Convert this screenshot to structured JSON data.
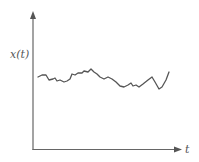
{
  "chart_data": {
    "type": "line",
    "title": "",
    "xlabel": "t",
    "ylabel": "x(t)",
    "grid": false,
    "legend": null,
    "axis_ranges": {
      "x": "unlabeled",
      "y": "unlabeled"
    },
    "series": [
      {
        "name": "x(t)",
        "points_px": [
          [
            38,
            77
          ],
          [
            42,
            75
          ],
          [
            46,
            75
          ],
          [
            49,
            80
          ],
          [
            53,
            79
          ],
          [
            55,
            78
          ],
          [
            57,
            81
          ],
          [
            60,
            80
          ],
          [
            64,
            82
          ],
          [
            67,
            81
          ],
          [
            70,
            79
          ],
          [
            72,
            74
          ],
          [
            75,
            75
          ],
          [
            78,
            73
          ],
          [
            82,
            73
          ],
          [
            84,
            71
          ],
          [
            88,
            72
          ],
          [
            91,
            69
          ],
          [
            94,
            72
          ],
          [
            97,
            74
          ],
          [
            100,
            77
          ],
          [
            104,
            79
          ],
          [
            108,
            77
          ],
          [
            112,
            79
          ],
          [
            116,
            82
          ],
          [
            120,
            86
          ],
          [
            124,
            87
          ],
          [
            128,
            85
          ],
          [
            131,
            83
          ],
          [
            133,
            86
          ],
          [
            136,
            85
          ],
          [
            139,
            87
          ],
          [
            143,
            84
          ],
          [
            148,
            80
          ],
          [
            152,
            77
          ],
          [
            155,
            82
          ],
          [
            159,
            89
          ],
          [
            162,
            87
          ],
          [
            166,
            80
          ],
          [
            169,
            72
          ]
        ]
      }
    ],
    "colors": {
      "axis": "#666666",
      "line": "#555555"
    }
  },
  "labels": {
    "y_axis": "x(t)",
    "x_axis": "t"
  }
}
